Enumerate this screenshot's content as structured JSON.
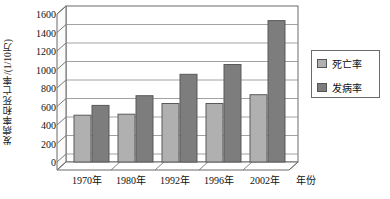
{
  "chart_data": {
    "type": "bar",
    "title": "",
    "xlabel": "年份",
    "ylabel": "发病率和死亡率/(1/10万)",
    "categories": [
      "1970年",
      "1980年",
      "1992年",
      "1996年",
      "2002年"
    ],
    "series": [
      {
        "name": "死亡率",
        "values": [
          480,
          490,
          600,
          600,
          690
        ],
        "color": "#b0b0b0"
      },
      {
        "name": "发病率",
        "values": [
          580,
          680,
          900,
          1000,
          1450
        ],
        "color": "#7d7d7d"
      }
    ],
    "ylim": [
      0,
      1600
    ],
    "ytick_step": 200,
    "yticks": [
      "0",
      "200",
      "400",
      "600",
      "800",
      "1000",
      "1200",
      "1400",
      "1600"
    ],
    "grid": true,
    "legend_position": "right",
    "style": "3d-perspective"
  },
  "legend": {
    "items": [
      {
        "label": "死亡率",
        "swatch_name": "legend-swatch-mortality"
      },
      {
        "label": "发病率",
        "swatch_name": "legend-swatch-incidence"
      }
    ]
  },
  "colors": {
    "series_light": "#b0b0b0",
    "series_dark": "#7d7d7d",
    "axis": "#6b6b6b",
    "grid": "#8a8a8a",
    "text": "#111111",
    "background": "#ffffff"
  }
}
